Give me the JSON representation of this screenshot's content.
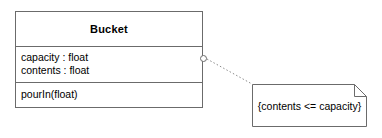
{
  "diagram": {
    "type": "uml-class-diagram",
    "background_color": "#ffffff",
    "line_color": "#6b6b6b",
    "text_color": "#000000"
  },
  "class": {
    "name": "Bucket",
    "attributes": [
      {
        "text": "capacity : float"
      },
      {
        "text": "contents : float"
      }
    ],
    "operations": [
      {
        "text": "pourIn(float)"
      }
    ]
  },
  "note": {
    "text": "{contents <= capacity}"
  },
  "connector": {
    "style": "dotted",
    "anchor": "hollow-circle"
  }
}
